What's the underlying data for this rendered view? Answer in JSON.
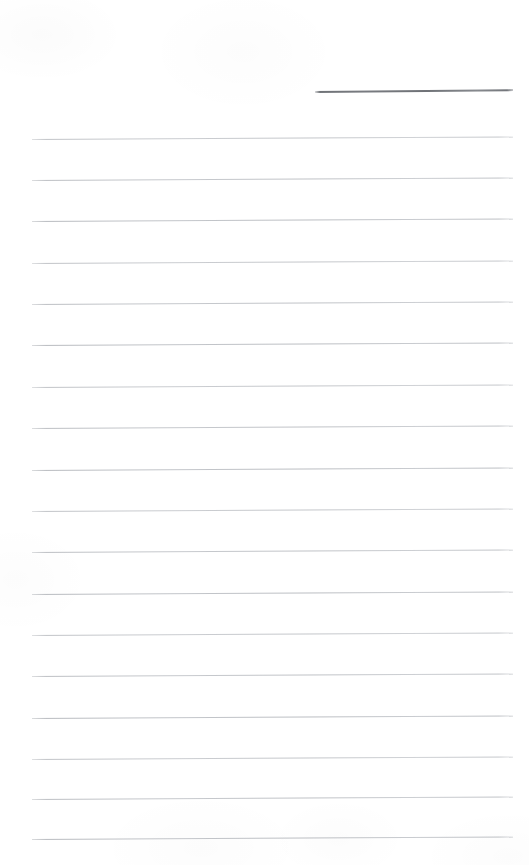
{
  "document": {
    "kind": "scanned-lined-page",
    "title": "Blank ruled notepad page",
    "page_width": 529,
    "page_height": 865,
    "background_color": "#ffffff",
    "has_visible_text": false,
    "text_content": ""
  },
  "header_rule": {
    "name": "header-rule",
    "description": "short dark horizontal rule in upper right",
    "color": "#6f7277",
    "x_start": 315,
    "x_end": 513,
    "y": 91,
    "thickness": 2,
    "skew_degrees": -0.55
  },
  "writing_rules": {
    "name": "writing-rules",
    "description": "light gray ruled writing lines",
    "color": "#b8bbc0",
    "count": 18,
    "x_start": 32,
    "x_end": 513,
    "thickness": 1,
    "spacing": 41.2,
    "skew_degrees": -0.3,
    "y_positions": [
      139,
      180,
      221,
      263,
      304,
      345,
      387,
      428,
      470,
      511,
      552,
      594,
      635,
      676,
      718,
      759,
      799,
      839
    ]
  }
}
